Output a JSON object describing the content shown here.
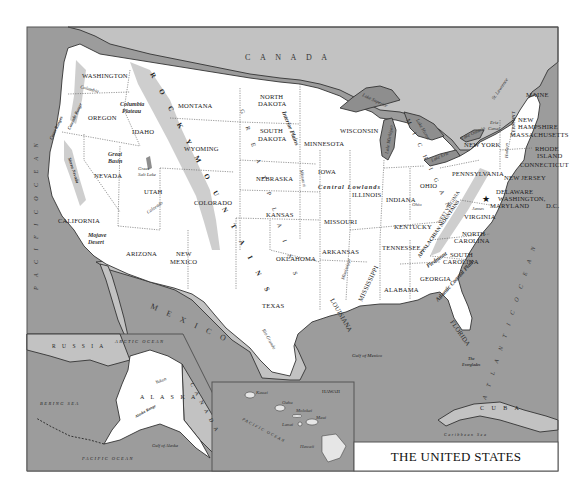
{
  "title": "THE UNITED STATES",
  "colors": {
    "ocean": "#9c9c9c",
    "foreign_land": "#c2c2c2",
    "us_land": "#ffffff",
    "lakes": "#8e8e8e",
    "frame": "#555555"
  },
  "countries": {
    "canada": "C A N A D A",
    "mexico": "M E X I C O",
    "cuba": "C U B A",
    "russia": "R U S S I A",
    "canada_inset": "C A N A D A"
  },
  "oceans": {
    "pacific": "P A C I F I C   O C E A N",
    "atlantic": "A T L A N T I C   O C E A N",
    "gulf_of_mexico": "Gulf of Mexico",
    "caribbean": "Caribbean Sea",
    "arctic": "ARCTIC OCEAN",
    "bering": "BERING SEA",
    "gulf_of_alaska": "Gulf of Alaska",
    "pacific_alaska": "PACIFIC OCEAN",
    "pacific_hawaii": "PACIFIC OCEAN"
  },
  "states": {
    "washington": "WASHINGTON",
    "oregon": "OREGON",
    "california": "CALIFORNIA",
    "idaho": "IDAHO",
    "nevada": "NEVADA",
    "utah": "UTAH",
    "arizona": "ARIZONA",
    "montana": "MONTANA",
    "wyoming": "WYOMING",
    "colorado": "COLORADO",
    "new_mexico_1": "NEW",
    "new_mexico_2": "MEXICO",
    "north_dakota_1": "NORTH",
    "north_dakota_2": "DAKOTA",
    "south_dakota_1": "SOUTH",
    "south_dakota_2": "DAKOTA",
    "nebraska": "NEBRASKA",
    "kansas": "KANSAS",
    "oklahoma": "OKLAHOMA",
    "texas": "TEXAS",
    "minnesota": "MINNESOTA",
    "iowa": "IOWA",
    "missouri": "MISSOURI",
    "arkansas": "ARKANSAS",
    "louisiana": "LOUISIANA",
    "wisconsin": "WISCONSIN",
    "illinois": "ILLINOIS",
    "michigan": "M I C H I G A N",
    "indiana": "INDIANA",
    "ohio": "OHIO",
    "kentucky": "KENTUCKY",
    "tennessee": "TENNESSEE",
    "mississippi": "MISSISSIPPI",
    "alabama": "ALABAMA",
    "georgia": "GEORGIA",
    "florida": "FLORIDA",
    "south_carolina_1": "SOUTH",
    "south_carolina_2": "CAROLINA",
    "north_carolina_1": "NORTH",
    "north_carolina_2": "CAROLINA",
    "virginia": "VIRGINIA",
    "west_virginia": "WEST VIRGINIA",
    "pennsylvania": "PENNSYLVANIA",
    "new_york": "NEW YORK",
    "vermont": "VERMONT",
    "new_hampshire_1": "NEW",
    "new_hampshire_2": "HAMPSHIRE",
    "maine": "MAINE",
    "massachusetts": "MASSACHUSETTS",
    "rhode_island_1": "RHODE",
    "rhode_island_2": "ISLAND",
    "connecticut": "CONNECTICUT",
    "new_jersey": "NEW JERSEY",
    "delaware": "DELAWARE",
    "maryland": "MARYLAND",
    "washington_dc_1": "WASHINGTON,",
    "washington_dc_2": "D.C.",
    "alaska": "A L A S K A",
    "hawaii": "HAWAII"
  },
  "physical": {
    "rocky_mountains": "R O C K Y   M O U N T A I N S",
    "great_plains": "G R E A T   P L A I N S",
    "interior_plains": "Interior Plains",
    "central_lowlands": "Central Lowlands",
    "appalachian": "APPALACHIAN MOUNTAINS",
    "piedmont": "Piedmont",
    "atlantic_coastal_plain": "Atlantic Coastal Plain",
    "columbia_plateau_1": "Columbia",
    "columbia_plateau_2": "Plateau",
    "great_basin_1": "Great",
    "great_basin_2": "Basin",
    "mojave_1": "Mojave",
    "mojave_2": "Desert",
    "coast_ranges": "Coast Ranges",
    "cascade": "Cascade Range",
    "sierra_nevada": "Sierra Nevada",
    "alaska_range": "Alaska Range",
    "everglades_1": "The",
    "everglades_2": "Everglades"
  },
  "water_features": {
    "great_salt_lake_1": "Great",
    "great_salt_lake_2": "Salt Lake",
    "lake_superior": "Lake Superior",
    "lake_michigan": "Lake Michigan",
    "lake_huron": "Lake Huron",
    "lake_erie": "Lake Erie",
    "lake_ontario": "Lake Ontario",
    "erie_canal_1": "Erie",
    "erie_canal_2": "Canal",
    "st_lawrence": "St. Lawrence",
    "columbia_river": "Columbia",
    "colorado_river": "Colorado",
    "missouri_river": "Missouri",
    "mississippi_river": "Mississippi",
    "ohio_river": "Ohio",
    "james_river": "James",
    "rio_grande": "Rio Grande",
    "yukon": "Yukon",
    "hudson": "Hudson"
  },
  "hawaii_islands": {
    "kauai": "Kauai",
    "oahu": "Oahu",
    "molokai": "Molokai",
    "maui": "Maui",
    "lanai": "Lanai",
    "hawaii": "Hawaii"
  }
}
